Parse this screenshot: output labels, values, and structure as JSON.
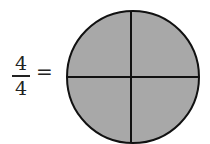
{
  "fraction": {
    "numerator": "4",
    "denominator": "4"
  },
  "equals_sign": "=",
  "circle": {
    "parts_total": 4,
    "parts_shaded": 4,
    "fill_color": "#a8a8a8",
    "stroke_color": "#111111"
  }
}
